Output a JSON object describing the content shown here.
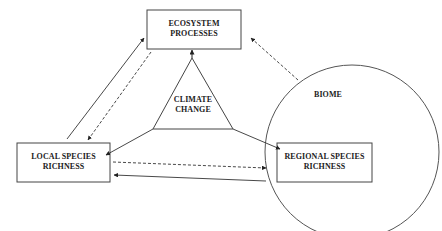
{
  "diagram": {
    "nodes": {
      "ecosystem": {
        "line1": "ECOSYSTEM",
        "line2": "PROCESSES"
      },
      "climate": {
        "line1": "CLIMATE",
        "line2": "CHANGE"
      },
      "local": {
        "line1": "LOCAL SPECIES",
        "line2": "RICHNESS"
      },
      "regional": {
        "line1": "REGIONAL SPECIES",
        "line2": "RICHNESS"
      },
      "biome": {
        "label": "BIOME"
      }
    },
    "edges": [
      {
        "from": "local",
        "to": "ecosystem",
        "style": "solid"
      },
      {
        "from": "ecosystem",
        "to": "local",
        "style": "dashed"
      },
      {
        "from": "biome",
        "to": "ecosystem",
        "style": "dashed"
      },
      {
        "from": "climate",
        "to": "ecosystem",
        "style": "solid"
      },
      {
        "from": "climate",
        "to": "local",
        "style": "solid"
      },
      {
        "from": "climate",
        "to": "regional",
        "style": "solid"
      },
      {
        "from": "local",
        "to": "regional",
        "style": "dashed"
      },
      {
        "from": "regional",
        "to": "local",
        "style": "solid"
      }
    ],
    "colors": {
      "line": "#333333",
      "background": "#ffffff"
    }
  }
}
